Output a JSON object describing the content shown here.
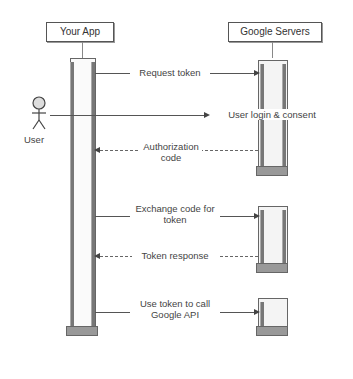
{
  "participants": {
    "app": "Your App",
    "google": "Google Servers",
    "user": "User"
  },
  "messages": [
    {
      "label": "Request token",
      "from": "app",
      "to": "google",
      "style": "solid"
    },
    {
      "label": "User login & consent",
      "from": "user",
      "to": "google",
      "style": "solid"
    },
    {
      "label": "Authorization code",
      "from": "google",
      "to": "app",
      "style": "dashed"
    },
    {
      "label": "Exchange code for token",
      "from": "app",
      "to": "google",
      "style": "solid"
    },
    {
      "label": "Token response",
      "from": "google",
      "to": "app",
      "style": "dashed"
    },
    {
      "label": "Use token to call Google API",
      "from": "app",
      "to": "google",
      "style": "solid"
    }
  ],
  "icons": {
    "user": "person-icon"
  }
}
